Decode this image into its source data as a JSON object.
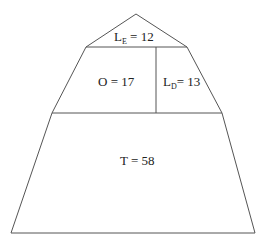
{
  "diagram": {
    "type": "pyramid",
    "regions": [
      {
        "id": "apex",
        "letter": "L",
        "subscript": "E",
        "equals": " = ",
        "value": "12"
      },
      {
        "id": "middle-left",
        "letter": "O",
        "equals": " = ",
        "value": "17",
        "text": "O = 17"
      },
      {
        "id": "middle-right",
        "letter": "L",
        "subscript": "D",
        "equals": "= ",
        "value": "13"
      },
      {
        "id": "bottom",
        "letter": "T",
        "equals": " = ",
        "value": "58",
        "text": "T = 58"
      }
    ],
    "colors": {
      "line": "#555555",
      "text": "#222222",
      "background": "#ffffff"
    }
  }
}
